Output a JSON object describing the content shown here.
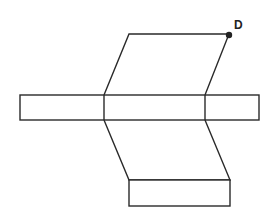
{
  "diagram": {
    "type": "net of a prism",
    "labels": [
      {
        "text": "D",
        "point": "top-right vertex of top face"
      }
    ],
    "colors": {
      "stroke": "#2a2a2a",
      "background": "#ffffff",
      "point": "#222222"
    }
  }
}
